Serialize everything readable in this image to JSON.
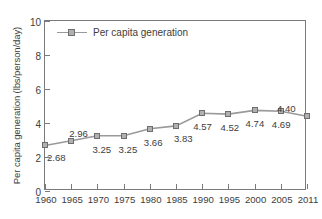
{
  "chart_data": {
    "type": "line",
    "title": "",
    "xlabel": "",
    "ylabel": "Per capita generation (lbs/person/day)",
    "x": [
      1960,
      1965,
      1970,
      1975,
      1980,
      1985,
      1990,
      1995,
      2000,
      2005,
      2011
    ],
    "xtick_labels": [
      "1960",
      "1965",
      "1970",
      "1975",
      "1980",
      "1985",
      "1990",
      "1995",
      "2000",
      "2005",
      "2011"
    ],
    "ylim": [
      0,
      10
    ],
    "ytick_values": [
      0,
      2,
      4,
      6,
      8,
      10
    ],
    "ytick_labels": [
      "0",
      "2",
      "4",
      "6",
      "8",
      "10"
    ],
    "grid": false,
    "legend_position": "top-left-inside",
    "series": [
      {
        "name": "Per capita generation",
        "values": [
          2.68,
          2.96,
          3.25,
          3.25,
          3.66,
          3.83,
          4.57,
          4.52,
          4.74,
          4.69,
          4.4
        ],
        "point_labels": [
          "2.68",
          "2.96",
          "3.25",
          "3.25",
          "3.66",
          "3.83",
          "4.57",
          "4.52",
          "4.74",
          "4.69",
          "4.40"
        ],
        "line_color": "#9a9a9a",
        "marker_color": "#b0b0b0",
        "marker_edge_color": "#6e6e6e",
        "marker": "square"
      }
    ]
  },
  "legend": {
    "label": "Per capita generation"
  },
  "axes": {
    "y_title": "Per capita generation (lbs/person/day)",
    "frame_color": "#7a7a7a"
  }
}
